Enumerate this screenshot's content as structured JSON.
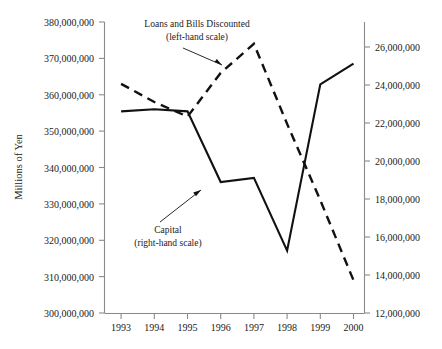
{
  "chart_data": {
    "type": "line",
    "title": "",
    "xlabel": "",
    "ylabel": "Millions of Yen",
    "y2label": "",
    "grid": false,
    "legend_position": "inline-annotations",
    "categories": [
      "1993",
      "1994",
      "1995",
      "1996",
      "1997",
      "1998",
      "1999",
      "2000"
    ],
    "ylim": [
      300000000,
      380000000
    ],
    "y2lim": [
      12000000,
      26000000
    ],
    "y_ticks": [
      "300,000,000",
      "310,000,000",
      "320,000,000",
      "330,000,000",
      "340,000,000",
      "350,000,000",
      "360,000,000",
      "370,000,000",
      "380,000,000"
    ],
    "y2_ticks": [
      "12,000,000",
      "14,000,000",
      "16,000,000",
      "18,000,000",
      "20,000,000",
      "22,000,000",
      "24,000,000",
      "26,000,000"
    ],
    "series": [
      {
        "name": "Loans and Bills Discounted",
        "axis": "left",
        "style": "dashed",
        "color": "#111111",
        "values": [
          363000000,
          358000000,
          354000000,
          366000000,
          374000000,
          352000000,
          331000000,
          309000000
        ]
      },
      {
        "name": "Capital",
        "axis": "right",
        "style": "solid",
        "color": "#111111",
        "values": [
          21700000,
          21800000,
          21700000,
          18300000,
          18500000,
          15000000,
          23000000,
          24000000
        ]
      }
    ],
    "annotations": [
      {
        "id": "loans-annotation",
        "line1": "Loans and Bills Discounted",
        "line2": "(left-hand scale)"
      },
      {
        "id": "capital-annotation",
        "line1": "Capital",
        "line2": "(right-hand scale)"
      }
    ],
    "caption": ""
  }
}
